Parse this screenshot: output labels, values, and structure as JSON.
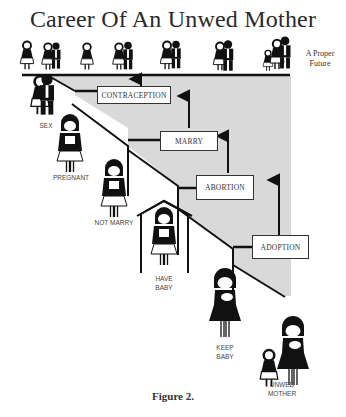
{
  "title": "Career Of An Unwed Mother",
  "top_line": {
    "end_label": "A Proper Future",
    "end_label_lines": [
      "A Proper",
      "Future"
    ],
    "figures": [
      {
        "name": "girl",
        "icon": "girl-icon"
      },
      {
        "name": "teen-couple",
        "icon": "couple-icon"
      },
      {
        "name": "young-woman",
        "icon": "woman-icon"
      },
      {
        "name": "dating-couple",
        "icon": "couple-icon"
      },
      {
        "name": "wedding-couple",
        "icon": "bride-groom-icon"
      },
      {
        "name": "embracing-couple",
        "icon": "couple-embrace-icon"
      },
      {
        "name": "family",
        "icon": "family-icon"
      }
    ]
  },
  "decision_boxes": [
    {
      "label": "CONTRACEPTION"
    },
    {
      "label": "MARRY"
    },
    {
      "label": "ABORTION"
    },
    {
      "label": "ADOPTION"
    }
  ],
  "stages": [
    {
      "label": "SEX",
      "icon": "couple-icon"
    },
    {
      "label": "PREGNANT",
      "icon": "pregnant-woman-icon"
    },
    {
      "label": "NOT MARRY",
      "icon": "pregnant-woman-icon"
    },
    {
      "label": "HAVE BABY",
      "label_lines": [
        "HAVE",
        "BABY"
      ],
      "icon": "woman-in-house-icon"
    },
    {
      "label": "KEEP BABY",
      "label_lines": [
        "KEEP",
        "BABY"
      ],
      "icon": "mother-with-baby-icon"
    },
    {
      "label": "UNWED MOTHER",
      "label_lines": [
        "UNWED",
        "MOTHER"
      ],
      "icon": "mother-with-child-icon"
    }
  ],
  "caption": "Figure 2.",
  "colors": {
    "shade": "#d9d9d9",
    "line": "#1a1a1a",
    "text": "#333333"
  }
}
